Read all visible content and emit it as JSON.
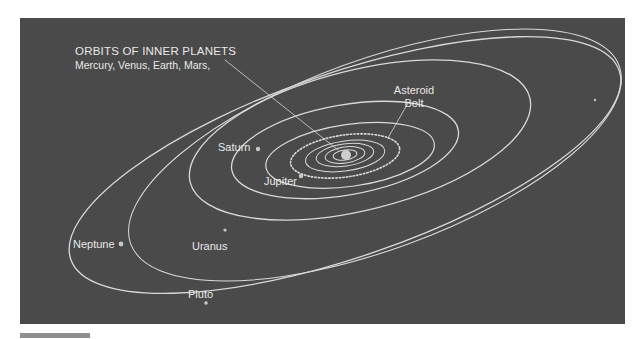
{
  "diagram": {
    "title": "ORBITS OF INNER PLANETS",
    "subtitle": "Mercury, Venus, Earth, Mars,",
    "labels": {
      "asteroid_belt_line1": "Asteroid",
      "asteroid_belt_line2": "Belt",
      "saturn": "Saturn",
      "jupiter": "Jupiter",
      "uranus": "Uranus",
      "neptune": "Neptune",
      "pluto": "Pluto"
    },
    "colors": {
      "background": "#4a4a4a",
      "orbit": "#d9d9d9",
      "text": "#e8e8e8",
      "footer_bar": "#8f8f8f"
    },
    "bodies": [
      "Sun",
      "Mercury",
      "Venus",
      "Earth",
      "Mars",
      "Asteroid Belt",
      "Jupiter",
      "Saturn",
      "Uranus",
      "Neptune",
      "Pluto"
    ]
  }
}
